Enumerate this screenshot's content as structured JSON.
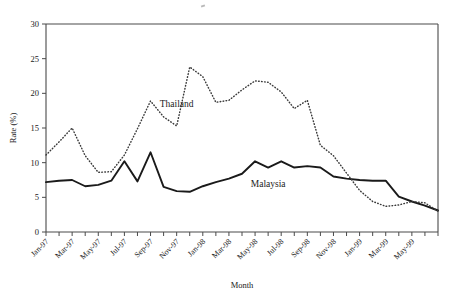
{
  "chart_data": {
    "type": "line",
    "title": "",
    "xlabel": "Month",
    "ylabel": "Rate (%)",
    "ylim": [
      0,
      30
    ],
    "ytick_values": [
      0,
      5,
      10,
      15,
      20,
      25,
      30
    ],
    "grid": false,
    "legend_position": "inline-annotations",
    "x": [
      "Jan-97",
      "Feb-97",
      "Mar-97",
      "Apr-97",
      "May-97",
      "Jun-97",
      "Jul-97",
      "Aug-97",
      "Sep-97",
      "Oct-97",
      "Nov-97",
      "Dec-97",
      "Jan-98",
      "Feb-98",
      "Mar-98",
      "Apr-98",
      "May-98",
      "Jun-98",
      "Jul-98",
      "Aug-98",
      "Sep-98",
      "Oct-98",
      "Nov-98",
      "Dec-98",
      "Jan-99",
      "Feb-99",
      "Mar-99",
      "Apr-99",
      "May-99",
      "Jun-99",
      "Jul-99"
    ],
    "xtick_labels": [
      "Jan-97",
      "Mar-97",
      "May-97",
      "Jul-97",
      "Sep-97",
      "Nov-97",
      "Jan-98",
      "Mar-98",
      "May-98",
      "Jul-98",
      "Sep-98",
      "Nov-98",
      "Jan-99",
      "Mar-99",
      "May-99"
    ],
    "series": [
      {
        "name": "Malaysia",
        "style": "solid",
        "color": "#1a1a1a",
        "values": [
          7.2,
          7.4,
          7.5,
          6.6,
          6.8,
          7.4,
          10.2,
          7.3,
          11.5,
          6.5,
          5.9,
          5.8,
          6.6,
          7.2,
          7.7,
          8.4,
          10.2,
          9.3,
          10.2,
          9.3,
          9.5,
          9.3,
          8.0,
          7.7,
          7.5,
          7.4,
          7.4,
          5.1,
          4.4,
          3.8,
          3.1
        ]
      },
      {
        "name": "Thailand",
        "style": "dotted",
        "color": "#3a3a3a",
        "values": [
          11.1,
          13.0,
          15.0,
          11.0,
          8.6,
          8.7,
          11.1,
          14.9,
          18.9,
          16.6,
          15.3,
          23.8,
          22.4,
          18.7,
          19.0,
          20.5,
          21.8,
          21.6,
          20.2,
          17.8,
          19.0,
          12.5,
          11.0,
          8.5,
          6.0,
          4.4,
          3.7,
          3.9,
          4.4,
          4.2,
          3.0
        ]
      }
    ],
    "annotations": [
      {
        "text": "Thailand",
        "x_index": 10,
        "y_value": 18.0
      },
      {
        "text": "Malaysia",
        "x_index": 17,
        "y_value": 6.5
      }
    ]
  }
}
